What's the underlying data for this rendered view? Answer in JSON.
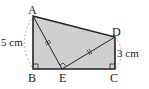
{
  "diagram": {
    "type": "geometry-figure",
    "points": {
      "A": {
        "label": "A",
        "x": 33,
        "y": 16
      },
      "B": {
        "label": "B",
        "x": 33,
        "y": 69
      },
      "E": {
        "label": "E",
        "x": 62,
        "y": 69
      },
      "C": {
        "label": "C",
        "x": 115,
        "y": 69
      },
      "D": {
        "label": "D",
        "x": 115,
        "y": 37
      }
    },
    "dimensions": {
      "AB": "5 cm",
      "DC": "3 cm"
    },
    "colors": {
      "fill": "#cfcfcf",
      "stroke": "#222222",
      "dashed_arc": "#888888"
    },
    "notes": {
      "equal_marks": "AE = ED",
      "right_angles": [
        "B",
        "C",
        "E"
      ]
    }
  }
}
